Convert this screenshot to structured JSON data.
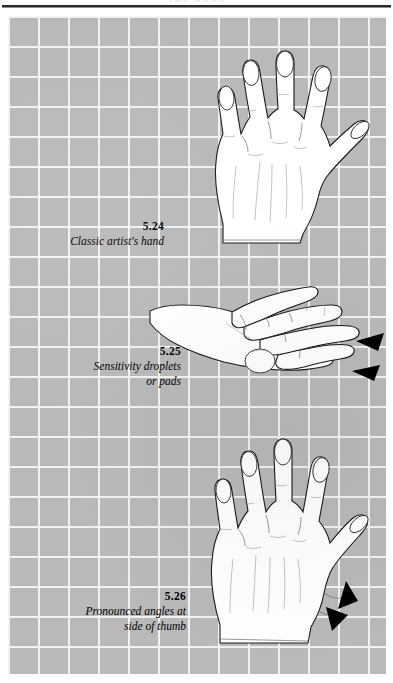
{
  "page": {
    "running_head": "THE HAND",
    "background_color": "#ffffff",
    "plate_color": "#b9b9b9",
    "grid_line_color": "#f2f2f2",
    "grid_spacing_px": 30,
    "rule_color": "#2b2b2b"
  },
  "figures": [
    {
      "id": "5.24",
      "number": "5.24",
      "caption": "Classic artist's hand",
      "illustration": "hand-back-view-fingers-spread",
      "annotations": []
    },
    {
      "id": "5.25",
      "number": "5.25",
      "caption": "Sensitivity droplets\nor pads",
      "illustration": "hand-side-view-fingertip-pads",
      "annotations": [
        "arrowhead-upper-fingertip",
        "arrowhead-lower-fingertip"
      ]
    },
    {
      "id": "5.26",
      "number": "5.26",
      "caption": "Pronounced angles at\nside of thumb",
      "illustration": "hand-back-view-thumb-angles",
      "annotations": [
        "arrowhead-upper-thumb-side",
        "arrowhead-lower-thumb-side"
      ]
    }
  ]
}
